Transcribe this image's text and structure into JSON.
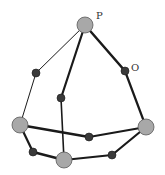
{
  "diagram": {
    "width": 165,
    "height": 175,
    "colors": {
      "edge": "#1a1a1a",
      "large_node_fill": "#a8a8a8",
      "large_node_stroke": "#5a5a5a",
      "small_node_fill": "#3a3a3a",
      "small_node_stroke": "#1a1a1a"
    },
    "labels": [
      {
        "id": "P",
        "text": "P",
        "x": 96,
        "y": 19
      },
      {
        "id": "O",
        "text": "O",
        "x": 131,
        "y": 71
      }
    ],
    "nodes": [
      {
        "id": "p",
        "x": 85,
        "y": 25,
        "r": 8,
        "kind": "large"
      },
      {
        "id": "o",
        "x": 125,
        "y": 71,
        "r": 4,
        "kind": "small"
      },
      {
        "id": "ls",
        "x": 36,
        "y": 73,
        "r": 4,
        "kind": "small"
      },
      {
        "id": "ms",
        "x": 61,
        "y": 98,
        "r": 4,
        "kind": "small"
      },
      {
        "id": "ll",
        "x": 20,
        "y": 125,
        "r": 8,
        "kind": "large"
      },
      {
        "id": "rl",
        "x": 146,
        "y": 127,
        "r": 8,
        "kind": "large"
      },
      {
        "id": "mb",
        "x": 89,
        "y": 137,
        "r": 4,
        "kind": "small"
      },
      {
        "id": "bls",
        "x": 33,
        "y": 152,
        "r": 4,
        "kind": "small"
      },
      {
        "id": "bl",
        "x": 64,
        "y": 160,
        "r": 8,
        "kind": "large"
      },
      {
        "id": "brs",
        "x": 112,
        "y": 155,
        "r": 4,
        "kind": "small"
      }
    ],
    "edges": [
      {
        "from": "p",
        "to": "ls",
        "w": 1
      },
      {
        "from": "ls",
        "to": "ll",
        "w": 1
      },
      {
        "from": "p",
        "to": "ms",
        "w": 2.2
      },
      {
        "from": "ms",
        "to": "bl",
        "w": 1.6
      },
      {
        "from": "p",
        "to": "o",
        "w": 2.5
      },
      {
        "from": "o",
        "to": "rl",
        "w": 2.2
      },
      {
        "from": "ll",
        "to": "mb",
        "w": 2.5
      },
      {
        "from": "mb",
        "to": "rl",
        "w": 2
      },
      {
        "from": "ll",
        "to": "bls",
        "w": 2.2
      },
      {
        "from": "bls",
        "to": "bl",
        "w": 2.5
      },
      {
        "from": "bl",
        "to": "brs",
        "w": 2.2
      },
      {
        "from": "brs",
        "to": "rl",
        "w": 2.2
      }
    ]
  }
}
